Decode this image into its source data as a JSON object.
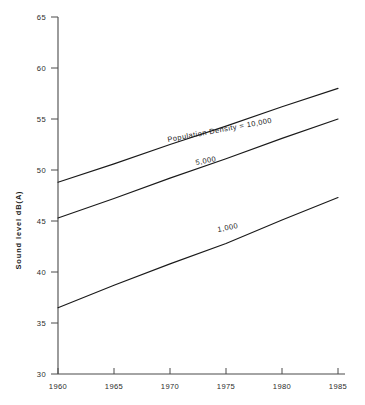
{
  "chart_data": {
    "type": "line",
    "title": "",
    "xlabel": "",
    "ylabel": "Sound level dB(A)",
    "xlim": [
      1960,
      1985
    ],
    "ylim": [
      30,
      65
    ],
    "grid": false,
    "legend_position": "inline-curve-labels",
    "x_ticks": [
      "1960",
      "1965",
      "1970",
      "1975",
      "1980",
      "1985"
    ],
    "y_ticks": [
      "30",
      "35",
      "40",
      "45",
      "50",
      "55",
      "60",
      "65"
    ],
    "x": [
      1960,
      1965,
      1970,
      1975,
      1980,
      1985
    ],
    "series": [
      {
        "name": "Population Density = 10,000",
        "label": "Population Density = 10,000",
        "values": [
          48.8,
          50.6,
          52.5,
          54.3,
          56.2,
          58.0
        ]
      },
      {
        "name": "5,000",
        "label": "5,000",
        "values": [
          45.3,
          47.2,
          49.2,
          51.1,
          53.1,
          55.0
        ]
      },
      {
        "name": "1,000",
        "label": "1,000",
        "values": [
          36.5,
          38.7,
          40.8,
          42.8,
          45.1,
          47.3
        ]
      }
    ]
  },
  "axis": {
    "y_title": "Sound level dB(A)",
    "y_ticks": [
      "65",
      "60",
      "55",
      "50",
      "45",
      "40",
      "35",
      "30"
    ],
    "x_ticks": [
      "1960",
      "1965",
      "1970",
      "1975",
      "1980",
      "1985"
    ]
  },
  "labels": {
    "top_curve": "Population Density = 10,000",
    "middle_curve": "5,000",
    "bottom_curve": "1,000"
  },
  "colors": {
    "line": "#1a1a1a",
    "axis": "#4a4a4a",
    "background": "#ffffff"
  }
}
